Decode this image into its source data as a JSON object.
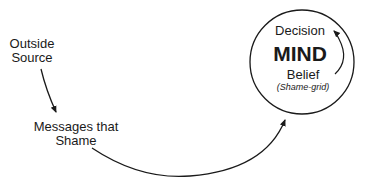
{
  "nodes": {
    "outside_source": {
      "line1": "Outside",
      "line2": "Source"
    },
    "messages": {
      "line1": "Messages that",
      "line2": "Shame"
    },
    "mind": {
      "decision": "Decision",
      "title": "MIND",
      "belief": "Belief",
      "note": "(Shame-grid)"
    }
  },
  "edges": [
    {
      "from": "Outside Source",
      "to": "Messages that Shame"
    },
    {
      "from": "Messages that Shame",
      "to": "MIND"
    },
    {
      "from": "Belief",
      "to": "Decision"
    }
  ],
  "colors": {
    "stroke": "#1a1a1a",
    "background": "#ffffff"
  }
}
